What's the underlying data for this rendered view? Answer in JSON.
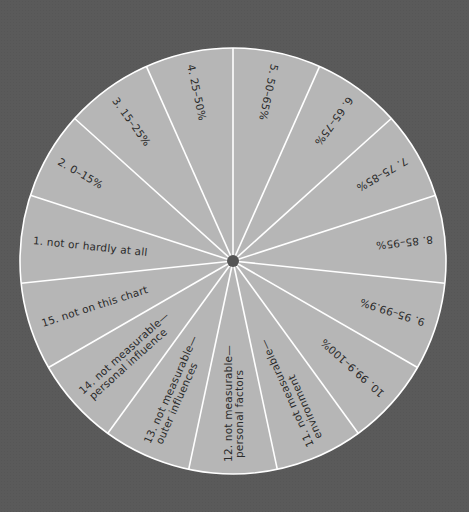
{
  "diagram": {
    "type": "segmented-wheel",
    "segment_count": 15,
    "colors": {
      "background": "#5a5a5a",
      "wheel_fill": "#b6b6b6",
      "spoke": "#ffffff",
      "rim": "#ffffff",
      "hub": "#555555",
      "label_text": "#2a2a2a"
    },
    "segments": [
      {
        "number": 1,
        "lines": [
          "1.  not or hardly at all"
        ]
      },
      {
        "number": 2,
        "lines": [
          "2.  0–15%"
        ]
      },
      {
        "number": 3,
        "lines": [
          "3.  15–25%"
        ]
      },
      {
        "number": 4,
        "lines": [
          "4.  25–50%"
        ]
      },
      {
        "number": 5,
        "lines": [
          "5.  50–65%"
        ]
      },
      {
        "number": 6,
        "lines": [
          "6.  65–75%"
        ]
      },
      {
        "number": 7,
        "lines": [
          "7.  75–85%"
        ]
      },
      {
        "number": 8,
        "lines": [
          "8.  85–95%"
        ]
      },
      {
        "number": 9,
        "lines": [
          "9.  95–99.9%"
        ]
      },
      {
        "number": 10,
        "lines": [
          "10.  99.9–100%"
        ]
      },
      {
        "number": 11,
        "lines": [
          "11.  not measurable—",
          "environment"
        ]
      },
      {
        "number": 12,
        "lines": [
          "12.  not measurable—",
          "personal factors"
        ]
      },
      {
        "number": 13,
        "lines": [
          "13.  not measurable—",
          "outer influences"
        ]
      },
      {
        "number": 14,
        "lines": [
          "14.  not measurable—",
          "personal influence"
        ]
      },
      {
        "number": 15,
        "lines": [
          "15.  not on this chart"
        ]
      }
    ]
  }
}
